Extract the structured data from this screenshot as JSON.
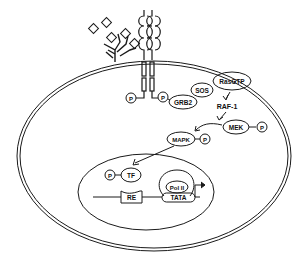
{
  "colors": {
    "stroke": "#1a1a1a",
    "background": "#ffffff"
  },
  "cytoplasm": {
    "receptor_phospho": [
      "P",
      "P"
    ],
    "adaptor": "GRB2",
    "gef": "SOS",
    "gtpase": "RasGTP",
    "kinase1": "RAF-1",
    "kinase2": "MEK",
    "kinase2_phospho": "P",
    "kinase3": "MAPK",
    "kinase3_phospho": "P"
  },
  "nucleus": {
    "tf_phospho": "P",
    "transcription_factor": "TF",
    "polymerase": "Pol II",
    "response_element": "RE",
    "promoter": "TATA"
  }
}
